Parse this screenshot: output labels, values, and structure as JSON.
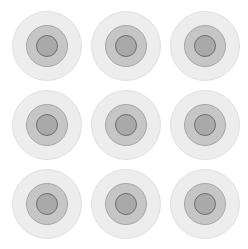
{
  "scene": {
    "description": "3x3 grid of concentric gray target circles",
    "rows": 3,
    "cols": 3,
    "colors": {
      "background": "#ffffff",
      "outer_ring": "#ededed",
      "mid_ring": "#c6c6c6",
      "core": "#a9a9a9",
      "core_outline": "#6e6e6e"
    },
    "targets": [
      {
        "row": 0,
        "col": 0,
        "cx": 47,
        "cy": 46
      },
      {
        "row": 0,
        "col": 1,
        "cx": 126,
        "cy": 46
      },
      {
        "row": 0,
        "col": 2,
        "cx": 205,
        "cy": 46
      },
      {
        "row": 1,
        "col": 0,
        "cx": 47,
        "cy": 125
      },
      {
        "row": 1,
        "col": 1,
        "cx": 126,
        "cy": 125
      },
      {
        "row": 1,
        "col": 2,
        "cx": 205,
        "cy": 125
      },
      {
        "row": 2,
        "col": 0,
        "cx": 47,
        "cy": 204
      },
      {
        "row": 2,
        "col": 1,
        "cx": 126,
        "cy": 204
      },
      {
        "row": 2,
        "col": 2,
        "cx": 205,
        "cy": 204
      }
    ]
  }
}
